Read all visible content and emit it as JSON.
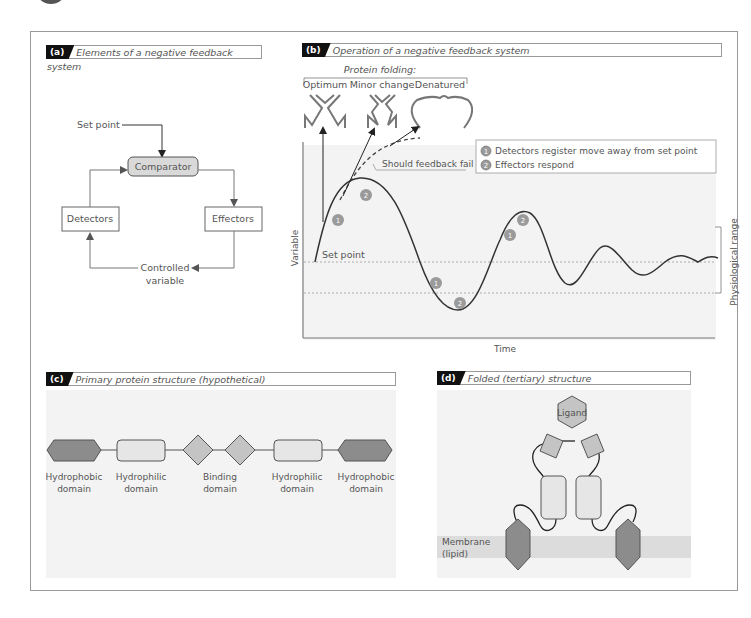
{
  "panels": {
    "a": {
      "tag": "(a)",
      "title": "Elements of a negative feedback system",
      "nodes": {
        "set_point": "Set point",
        "comparator": "Comparator",
        "detectors": "Detectors",
        "effectors": "Effectors",
        "controlled_variable_line1": "Controlled",
        "controlled_variable_line2": "variable"
      }
    },
    "b": {
      "tag": "(b)",
      "title": "Operation of a negative feedback system",
      "protein_folding_header": "Protein folding:",
      "folding_states": [
        "Optimum",
        "Minor change",
        "Denatured"
      ],
      "failure_label": "Should feedback fail",
      "legend": [
        {
          "marker": "1",
          "text": "Detectors register move away from set point"
        },
        {
          "marker": "2",
          "text": "Effectors respond"
        }
      ],
      "set_point_label": "Set point",
      "ylabel": "Variable",
      "xlabel": "Time",
      "range_label": "Physiological range"
    },
    "c": {
      "tag": "(c)",
      "title": "Primary protein structure (hypothetical)",
      "domains": [
        {
          "line1": "Hydrophobic",
          "line2": "domain"
        },
        {
          "line1": "Hydrophilic",
          "line2": "domain"
        },
        {
          "line1": "Binding",
          "line2": "domain"
        },
        {
          "line1": "Hydrophilic",
          "line2": "domain"
        },
        {
          "line1": "Hydrophobic",
          "line2": "domain"
        }
      ]
    },
    "d": {
      "tag": "(d)",
      "title": "Folded (tertiary) structure",
      "ligand": "Ligand",
      "membrane_line1": "Membrane",
      "membrane_line2": "(lipid)"
    }
  },
  "colors": {
    "hydrophobic": "#8c8c8c",
    "hydrophilic": "#e6e6e6",
    "binding": "#c4c4c4",
    "comparator": "#d9d9d9",
    "marker": "#9a9a9a",
    "membrane": "#dcdcdc"
  }
}
